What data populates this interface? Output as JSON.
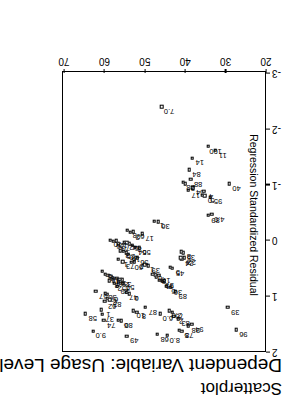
{
  "chart": {
    "title": "Scatterplot",
    "subtitle": "Dependent Variable: Usage Level",
    "xlabel": "",
    "ylabel": "Regression Standardized Residual"
  },
  "axes": {
    "x_ticks": [
      "20",
      "30",
      "40",
      "50",
      "60",
      "70"
    ],
    "y_ticks": [
      "-3",
      "-2",
      "-1",
      "0",
      "1",
      "2"
    ]
  },
  "chart_data": {
    "type": "scatter",
    "title": "Scatterplot",
    "subtitle": "Dependent Variable: Usage Level",
    "xlabel": "",
    "ylabel": "Regression Standardized Residual",
    "xlim": [
      20,
      70
    ],
    "ylim": [
      -3,
      2
    ],
    "xticks": [
      20,
      30,
      40,
      50,
      60,
      70
    ],
    "yticks": [
      -3,
      -2,
      -1,
      0,
      1,
      2
    ],
    "grid": false,
    "legend": false,
    "marker": "open-square",
    "point_labels_shown": true,
    "note": "Each marker carries a case-number label; many labels overlap in the dense central cluster.",
    "points": [
      {
        "label": "96",
        "x": 27.2,
        "y": 1.62
      },
      {
        "label": "39",
        "x": 29.2,
        "y": 1.22
      },
      {
        "label": "94",
        "x": 38.1,
        "y": 1.52
      },
      {
        "label": "98",
        "x": 39.0,
        "y": 1.55
      },
      {
        "label": "78",
        "x": 40.6,
        "y": 1.64
      },
      {
        "label": "5",
        "x": 41.3,
        "y": 1.63
      },
      {
        "label": "8.0",
        "x": 44.2,
        "y": 1.72
      },
      {
        "label": "68",
        "x": 46.7,
        "y": 1.7
      },
      {
        "label": "83",
        "x": 41.5,
        "y": 1.42
      },
      {
        "label": "2",
        "x": 42.6,
        "y": 1.38
      },
      {
        "label": "75",
        "x": 43.0,
        "y": 1.3
      },
      {
        "label": "2.0",
        "x": 43.7,
        "y": 1.28
      },
      {
        "label": "6.0",
        "x": 45.9,
        "y": 1.33
      },
      {
        "label": "87",
        "x": 49.6,
        "y": 1.22
      },
      {
        "label": "8",
        "x": 51.8,
        "y": 1.3
      },
      {
        "label": "10",
        "x": 52.6,
        "y": 1.28
      },
      {
        "label": "80",
        "x": 55.6,
        "y": 1.46
      },
      {
        "label": "6",
        "x": 56.3,
        "y": 1.45
      },
      {
        "label": "49",
        "x": 54.2,
        "y": 1.73
      },
      {
        "label": "9.0",
        "x": 62.5,
        "y": 1.64
      },
      {
        "label": "58",
        "x": 64.5,
        "y": 1.33
      },
      {
        "label": "74",
        "x": 59.9,
        "y": 1.45
      },
      {
        "label": "37",
        "x": 60.3,
        "y": 1.34
      },
      {
        "label": "1",
        "x": 60.6,
        "y": 1.26
      },
      {
        "label": "62",
        "x": 59.7,
        "y": 1.11
      },
      {
        "label": "67",
        "x": 59.2,
        "y": 0.98
      },
      {
        "label": "38",
        "x": 59.6,
        "y": 0.96
      },
      {
        "label": "57",
        "x": 61.9,
        "y": 0.93
      },
      {
        "label": "89",
        "x": 42.2,
        "y": 0.93
      },
      {
        "label": "36",
        "x": 43.4,
        "y": 0.86
      },
      {
        "label": "5",
        "x": 44.5,
        "y": 0.84
      },
      {
        "label": "3",
        "x": 44.9,
        "y": 0.74
      },
      {
        "label": "61",
        "x": 45.5,
        "y": 0.75
      },
      {
        "label": "9",
        "x": 46.1,
        "y": 0.73
      },
      {
        "label": "8",
        "x": 46.9,
        "y": 0.67
      },
      {
        "label": "17",
        "x": 46.3,
        "y": 0.64
      },
      {
        "label": "7",
        "x": 47.2,
        "y": 0.63
      },
      {
        "label": "6",
        "x": 47.8,
        "y": 0.62
      },
      {
        "label": "45",
        "x": 42.9,
        "y": 0.52
      },
      {
        "label": "5",
        "x": 43.4,
        "y": 0.5
      },
      {
        "label": "24",
        "x": 40.6,
        "y": 0.35
      },
      {
        "label": "22",
        "x": 40.0,
        "y": 0.33
      },
      {
        "label": "4",
        "x": 40.9,
        "y": 0.33
      },
      {
        "label": "35",
        "x": 40.2,
        "y": 0.24
      },
      {
        "label": "8",
        "x": 40.7,
        "y": 0.22
      },
      {
        "label": "39",
        "x": 48.9,
        "y": 0.47
      },
      {
        "label": "1",
        "x": 49.8,
        "y": 0.45
      },
      {
        "label": "6",
        "x": 53.6,
        "y": 0.97
      },
      {
        "label": "47",
        "x": 54.4,
        "y": 0.95
      },
      {
        "label": "50",
        "x": 55.2,
        "y": 0.78
      },
      {
        "label": "7",
        "x": 55.8,
        "y": 0.79
      },
      {
        "label": "29",
        "x": 56.6,
        "y": 0.84
      },
      {
        "label": "52",
        "x": 57.3,
        "y": 0.79
      },
      {
        "label": "3",
        "x": 55.4,
        "y": 0.72
      },
      {
        "label": "2",
        "x": 56.0,
        "y": 0.71
      },
      {
        "label": "5",
        "x": 56.7,
        "y": 0.7
      },
      {
        "label": "43",
        "x": 57.6,
        "y": 0.7
      },
      {
        "label": "3",
        "x": 58.6,
        "y": 0.74
      },
      {
        "label": "4",
        "x": 58.2,
        "y": 0.66
      },
      {
        "label": "16",
        "x": 58.9,
        "y": 0.64
      },
      {
        "label": "9",
        "x": 59.6,
        "y": 0.62
      },
      {
        "label": "5",
        "x": 60.3,
        "y": 0.57
      },
      {
        "label": "82",
        "x": 58.4,
        "y": 1.08
      },
      {
        "label": "2",
        "x": 59.0,
        "y": 1.05
      },
      {
        "label": "56",
        "x": 51.7,
        "y": 0.33
      },
      {
        "label": "2",
        "x": 52.4,
        "y": 0.4
      },
      {
        "label": "60",
        "x": 53.1,
        "y": 0.41
      },
      {
        "label": "73",
        "x": 55.2,
        "y": 0.4
      },
      {
        "label": "1",
        "x": 56.3,
        "y": 0.36
      },
      {
        "label": "16",
        "x": 53.8,
        "y": 0.27
      },
      {
        "label": "40",
        "x": 54.4,
        "y": 0.24
      },
      {
        "label": "25",
        "x": 55.1,
        "y": 0.21
      },
      {
        "label": "3",
        "x": 55.9,
        "y": 0.2
      },
      {
        "label": "56",
        "x": 51.2,
        "y": 0.15
      },
      {
        "label": "54",
        "x": 52.2,
        "y": 0.14
      },
      {
        "label": "8",
        "x": 52.9,
        "y": 0.1
      },
      {
        "label": "6",
        "x": 53.6,
        "y": 0.08
      },
      {
        "label": "4",
        "x": 54.2,
        "y": 0.06
      },
      {
        "label": "2",
        "x": 54.9,
        "y": 0.05
      },
      {
        "label": "70",
        "x": 56.3,
        "y": 0.08
      },
      {
        "label": "12",
        "x": 56.9,
        "y": 0.02
      },
      {
        "label": "26",
        "x": 57.6,
        "y": 0.03
      },
      {
        "label": "70",
        "x": 58.3,
        "y": 0.01
      },
      {
        "label": "17",
        "x": 50.4,
        "y": -0.1
      },
      {
        "label": "60",
        "x": 52.7,
        "y": -0.14
      },
      {
        "label": "2",
        "x": 53.4,
        "y": -0.13
      },
      {
        "label": "8",
        "x": 54.1,
        "y": -0.16
      },
      {
        "label": "36",
        "x": 46.5,
        "y": -0.32
      },
      {
        "label": "1",
        "x": 47.4,
        "y": -0.33
      },
      {
        "label": "64",
        "x": 37.9,
        "y": -0.93
      },
      {
        "label": "17",
        "x": 39.0,
        "y": -0.88
      },
      {
        "label": "88",
        "x": 38.4,
        "y": -1.08
      },
      {
        "label": "28",
        "x": 40.3,
        "y": -1.02
      },
      {
        "label": "2",
        "x": 39.7,
        "y": -1.0
      },
      {
        "label": "84",
        "x": 38.8,
        "y": -1.25
      },
      {
        "label": "14",
        "x": 38.0,
        "y": -1.46
      },
      {
        "label": "4.0",
        "x": 33.2,
        "y": -0.45
      },
      {
        "label": "89",
        "x": 34.1,
        "y": -0.43
      },
      {
        "label": "95",
        "x": 33.5,
        "y": -0.76
      },
      {
        "label": "5",
        "x": 34.9,
        "y": -0.78
      },
      {
        "label": "0",
        "x": 35.5,
        "y": -0.79
      },
      {
        "label": "4",
        "x": 35.2,
        "y": -0.86
      },
      {
        "label": "40",
        "x": 28.9,
        "y": -1.0
      },
      {
        "label": "11",
        "x": 32.3,
        "y": -1.6
      },
      {
        "label": "100",
        "x": 34.1,
        "y": -1.67
      },
      {
        "label": "7.0",
        "x": 45.6,
        "y": -2.38
      }
    ]
  }
}
